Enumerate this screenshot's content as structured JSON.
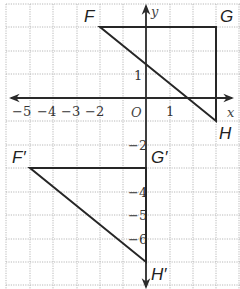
{
  "diagram": {
    "title": "",
    "axes": {
      "x_label": "x",
      "y_label": "y",
      "origin_label": "O",
      "x_ticks": [
        {
          "value": -5,
          "label": "−5"
        },
        {
          "value": -4,
          "label": "−4"
        },
        {
          "value": -3,
          "label": "−3"
        },
        {
          "value": -2,
          "label": "−2"
        },
        {
          "value": 1,
          "label": "1"
        }
      ],
      "y_ticks": [
        {
          "value": 1,
          "label": "1"
        },
        {
          "value": -2,
          "label": "−2"
        },
        {
          "value": -4,
          "label": "−4"
        },
        {
          "value": -5,
          "label": "−5"
        },
        {
          "value": -6,
          "label": "−6"
        }
      ],
      "x_range": [
        -6,
        4
      ],
      "y_range": [
        -8,
        4
      ]
    },
    "triangles": [
      {
        "name": "FGH",
        "vertices": [
          {
            "label": "F",
            "x": -2,
            "y": 2
          },
          {
            "label": "G",
            "x": 3,
            "y": 2
          },
          {
            "label": "H",
            "x": 3,
            "y": -1
          }
        ]
      },
      {
        "name": "F'G'H'",
        "vertices": [
          {
            "label": "F′",
            "x": -5,
            "y": -3
          },
          {
            "label": "G′",
            "x": 0,
            "y": -3
          },
          {
            "label": "H′",
            "x": 0,
            "y": -7
          }
        ]
      }
    ],
    "colors": {
      "grid": "#b8b8b8",
      "lines": "#262626",
      "background": "#ffffff"
    }
  }
}
